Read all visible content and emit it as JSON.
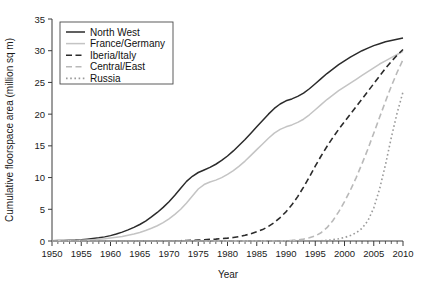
{
  "chart_data": {
    "type": "line",
    "title": "",
    "xlabel": "Year",
    "ylabel": "Cumulative floorspace area (million sq m)",
    "xlim": [
      1950,
      2010
    ],
    "ylim": [
      0,
      35
    ],
    "xticks": [
      1950,
      1955,
      1960,
      1965,
      1970,
      1975,
      1980,
      1985,
      1990,
      1995,
      2000,
      2005,
      2010
    ],
    "yticks": [
      0,
      5,
      10,
      15,
      20,
      25,
      30,
      35
    ],
    "xtick_labels": [
      "1950",
      "1955",
      "1960",
      "1965",
      "1970",
      "1975",
      "1980",
      "1985",
      "1990",
      "1995",
      "2000",
      "2005",
      "2010"
    ],
    "ytick_labels": [
      "0",
      "5",
      "10",
      "15",
      "20",
      "25",
      "30",
      "35"
    ],
    "minor_tick_interval": 1,
    "grid": false,
    "legend_position": "top-left",
    "x": [
      1950,
      1951,
      1952,
      1953,
      1954,
      1955,
      1956,
      1957,
      1958,
      1959,
      1960,
      1961,
      1962,
      1963,
      1964,
      1965,
      1966,
      1967,
      1968,
      1969,
      1970,
      1971,
      1972,
      1973,
      1974,
      1975,
      1976,
      1977,
      1978,
      1979,
      1980,
      1981,
      1982,
      1983,
      1984,
      1985,
      1986,
      1987,
      1988,
      1989,
      1990,
      1991,
      1992,
      1993,
      1994,
      1995,
      1996,
      1997,
      1998,
      1999,
      2000,
      2001,
      2002,
      2003,
      2004,
      2005,
      2006,
      2007,
      2008,
      2009,
      2010
    ],
    "series": [
      {
        "name": "North West",
        "style": "solid",
        "color": "#2b2b2b",
        "width": 1.5,
        "values": [
          0.05,
          0.07,
          0.09,
          0.12,
          0.15,
          0.2,
          0.28,
          0.38,
          0.5,
          0.65,
          0.85,
          1.1,
          1.4,
          1.75,
          2.15,
          2.6,
          3.15,
          3.8,
          4.5,
          5.3,
          6.2,
          7.2,
          8.3,
          9.4,
          10.2,
          10.8,
          11.2,
          11.6,
          12.1,
          12.7,
          13.4,
          14.2,
          15.1,
          16.0,
          17.0,
          18.0,
          19.0,
          20.0,
          20.9,
          21.6,
          22.1,
          22.4,
          22.8,
          23.3,
          24.0,
          24.8,
          25.6,
          26.4,
          27.1,
          27.8,
          28.4,
          29.0,
          29.5,
          30.0,
          30.4,
          30.8,
          31.1,
          31.4,
          31.6,
          31.8,
          32.0
        ]
      },
      {
        "name": "France/Germany",
        "style": "solid",
        "color": "#c4c4c4",
        "width": 1.5,
        "values": [
          0.03,
          0.04,
          0.05,
          0.07,
          0.09,
          0.12,
          0.16,
          0.21,
          0.28,
          0.36,
          0.46,
          0.58,
          0.72,
          0.9,
          1.1,
          1.35,
          1.65,
          2.0,
          2.4,
          2.9,
          3.5,
          4.2,
          5.0,
          6.0,
          7.1,
          8.2,
          8.9,
          9.3,
          9.6,
          10.0,
          10.5,
          11.1,
          11.8,
          12.6,
          13.5,
          14.4,
          15.3,
          16.2,
          17.0,
          17.6,
          18.0,
          18.3,
          18.7,
          19.2,
          19.9,
          20.7,
          21.5,
          22.3,
          23.0,
          23.7,
          24.3,
          24.9,
          25.5,
          26.1,
          26.7,
          27.3,
          27.9,
          28.4,
          28.9,
          29.4,
          29.9
        ]
      },
      {
        "name": "Iberia/Italy",
        "style": "dashed",
        "color": "#2b2b2b",
        "width": 1.6,
        "values": [
          0.0,
          0.0,
          0.0,
          0.0,
          0.0,
          0.0,
          0.0,
          0.0,
          0.0,
          0.0,
          0.0,
          0.0,
          0.0,
          0.0,
          0.0,
          0.0,
          0.0,
          0.0,
          0.0,
          0.0,
          0.02,
          0.03,
          0.05,
          0.07,
          0.1,
          0.15,
          0.2,
          0.25,
          0.3,
          0.38,
          0.45,
          0.55,
          0.7,
          0.9,
          1.15,
          1.45,
          1.8,
          2.3,
          2.9,
          3.7,
          4.6,
          5.7,
          7.0,
          8.5,
          10.1,
          11.8,
          13.4,
          14.9,
          16.3,
          17.6,
          18.8,
          20.0,
          21.2,
          22.4,
          23.6,
          24.8,
          26.0,
          27.2,
          28.3,
          29.3,
          30.2
        ]
      },
      {
        "name": "Central/East",
        "style": "dashed",
        "color": "#b9b9b9",
        "width": 1.6,
        "values": [
          0.0,
          0.0,
          0.0,
          0.0,
          0.0,
          0.0,
          0.0,
          0.0,
          0.0,
          0.0,
          0.0,
          0.0,
          0.0,
          0.0,
          0.0,
          0.0,
          0.0,
          0.0,
          0.0,
          0.0,
          0.0,
          0.0,
          0.0,
          0.0,
          0.0,
          0.0,
          0.0,
          0.0,
          0.0,
          0.0,
          0.0,
          0.0,
          0.0,
          0.0,
          0.0,
          0.0,
          0.0,
          0.0,
          0.0,
          0.0,
          0.05,
          0.1,
          0.18,
          0.3,
          0.5,
          0.8,
          1.3,
          2.1,
          3.2,
          4.6,
          6.2,
          8.0,
          10.0,
          12.2,
          14.5,
          17.0,
          19.5,
          22.0,
          24.4,
          26.6,
          28.6
        ]
      },
      {
        "name": "Russia",
        "style": "dotted",
        "color": "#9a9a9a",
        "width": 1.6,
        "values": [
          0.0,
          0.0,
          0.0,
          0.0,
          0.0,
          0.0,
          0.0,
          0.0,
          0.0,
          0.0,
          0.0,
          0.0,
          0.0,
          0.0,
          0.0,
          0.0,
          0.0,
          0.0,
          0.0,
          0.0,
          0.0,
          0.0,
          0.0,
          0.0,
          0.0,
          0.0,
          0.0,
          0.0,
          0.0,
          0.0,
          0.0,
          0.0,
          0.0,
          0.0,
          0.0,
          0.0,
          0.0,
          0.0,
          0.0,
          0.0,
          0.0,
          0.0,
          0.0,
          0.0,
          0.0,
          0.0,
          0.05,
          0.1,
          0.2,
          0.35,
          0.55,
          0.85,
          1.3,
          2.0,
          3.2,
          5.2,
          8.2,
          12.0,
          16.3,
          20.2,
          23.5
        ]
      }
    ]
  },
  "legend": {
    "items": [
      {
        "label": "North West"
      },
      {
        "label": "France/Germany"
      },
      {
        "label": "Iberia/Italy"
      },
      {
        "label": "Central/East"
      },
      {
        "label": "Russia"
      }
    ]
  }
}
